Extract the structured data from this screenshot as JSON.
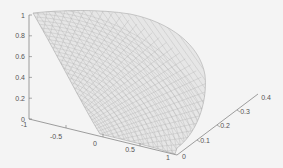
{
  "chart_data": {
    "type": "surface-mesh-3d",
    "title": "",
    "xlabel": "",
    "ylabel": "",
    "zlabel": "",
    "x_ticks": [
      "-1",
      "-0.5",
      "0",
      "0.5",
      "1"
    ],
    "y_ticks": [
      "0",
      "0.1",
      "0.2",
      "0.3",
      "0.4"
    ],
    "z_ticks": [
      "0",
      "0.2",
      "0.4",
      "0.6",
      "0.8",
      "1"
    ],
    "xlim": [
      -1,
      1
    ],
    "ylim": [
      0,
      0.4
    ],
    "zlim": [
      0,
      1
    ],
    "grid": false,
    "legend": null
  },
  "axes": {
    "z": {
      "t0": "0",
      "t1": "0.2",
      "t2": "0.4",
      "t3": "0.6",
      "t4": "0.8",
      "t5": "1"
    },
    "x": {
      "t0": "-1",
      "t1": "-0.5",
      "t2": "0",
      "t3": "0.5",
      "t4": "1"
    },
    "y": {
      "t0": "0",
      "t1": "0.1",
      "t2": "0.2",
      "t3": "0.3",
      "t4": "0.4"
    }
  },
  "colors": {
    "background": "#f4f4f4",
    "axis": "#777777",
    "mesh": "#b8b8b8",
    "mesh_fill": "#e6e6e6"
  }
}
